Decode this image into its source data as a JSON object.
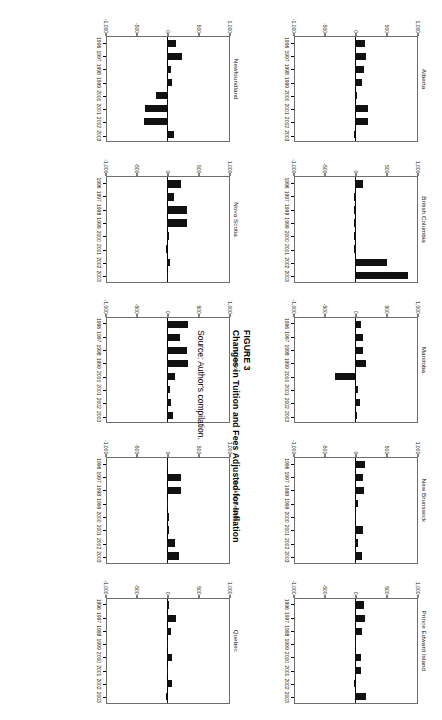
{
  "figure": {
    "label": "FIGURE 3",
    "title": "Changes in Tuition and Fees Adjusted for Inflation",
    "source": "Source: Author's compilation."
  },
  "axis": {
    "y_ticks": [
      "1,000",
      "500",
      "0",
      "-500",
      "-1,000"
    ],
    "x_ticks": [
      "1996",
      "1997",
      "1998",
      "1999",
      "2000",
      "2001",
      "2002",
      "2003"
    ]
  },
  "chart_data": {
    "type": "bar",
    "title": "Changes in Tuition and Fees Adjusted for Inflation",
    "xlabel": "",
    "ylabel": "",
    "ylim": [
      -1000,
      1000
    ],
    "categories": [
      "1996",
      "1997",
      "1998",
      "1999",
      "2000",
      "2001",
      "2002",
      "2003"
    ],
    "grid": false,
    "legend": "none",
    "panels": [
      {
        "name": "Alberta",
        "values": [
          165,
          180,
          150,
          120,
          35,
          210,
          215,
          0
        ]
      },
      {
        "name": "British Columbia",
        "values": [
          125,
          10,
          10,
          10,
          10,
          10,
          520,
          860
        ]
      },
      {
        "name": "Manitoba",
        "values": [
          95,
          135,
          130,
          175,
          -330,
          55,
          80,
          35
        ]
      },
      {
        "name": "New Brunswick",
        "values": [
          160,
          135,
          150,
          50,
          20,
          130,
          55,
          110
        ]
      },
      {
        "name": "Prince Edward Island",
        "values": [
          150,
          160,
          110,
          15,
          95,
          100,
          0,
          175
        ]
      },
      {
        "name": "Newfoundland",
        "values": [
          150,
          245,
          60,
          85,
          -170,
          -360,
          -370,
          110
        ]
      },
      {
        "name": "Nova Scotia",
        "values": [
          225,
          120,
          330,
          330,
          30,
          0,
          55,
          15
        ]
      },
      {
        "name": "Ontario",
        "values": [
          340,
          210,
          330,
          340,
          135,
          55,
          60,
          90
        ]
      },
      {
        "name": "Saskatchewan",
        "values": [
          20,
          230,
          225,
          15,
          30,
          35,
          125,
          190
        ]
      },
      {
        "name": "Quebec",
        "values": [
          35,
          150,
          65,
          20,
          85,
          20,
          75,
          5
        ]
      }
    ]
  },
  "panel_order_row1": [
    "Alberta",
    "British Columbia",
    "Manitoba",
    "New Brunswick",
    "Prince Edward Island"
  ],
  "panel_order_row2": [
    "Newfoundland",
    "Nova Scotia",
    "Ontario",
    "Saskatchewan",
    "Quebec"
  ]
}
